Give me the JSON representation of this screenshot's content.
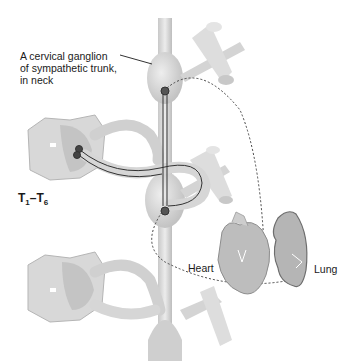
{
  "diagram": {
    "labels": {
      "ganglion": [
        "A cervical ganglion",
        "of sympathetic trunk,",
        "in neck"
      ],
      "segment_prefix": "T",
      "segment_start": "1",
      "segment_sep": "–",
      "segment_end": "6",
      "heart": "Heart",
      "lung": "Lung"
    },
    "colors": {
      "structure_fill": "#d9d9d9",
      "structure_shade": "#b8b8b8",
      "nerve_line": "#333333",
      "dashed_line": "#444444",
      "text": "#1a1a1a"
    }
  }
}
